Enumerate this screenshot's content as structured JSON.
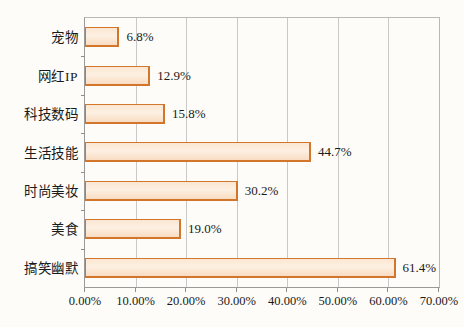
{
  "chart_data": {
    "type": "bar",
    "orientation": "horizontal",
    "title": "",
    "xlabel": "",
    "ylabel": "",
    "categories": [
      "宠物",
      "网红IP",
      "科技数码",
      "生活技能",
      "时尚美妆",
      "美食",
      "搞笑幽默"
    ],
    "values": [
      6.8,
      12.9,
      15.8,
      44.7,
      30.2,
      19.0,
      61.4
    ],
    "value_labels": [
      "6.8%",
      "12.9%",
      "15.8%",
      "44.7%",
      "30.2%",
      "19.0%",
      "61.4%"
    ],
    "xlim": [
      0,
      70
    ],
    "xticks": [
      0,
      10,
      20,
      30,
      40,
      50,
      60,
      70
    ],
    "xtick_labels": [
      "0.00%",
      "10.00%",
      "20.00%",
      "30.00%",
      "40.00%",
      "50.00%",
      "60.00%",
      "70.00%"
    ],
    "grid": "vertical",
    "legend": "none",
    "bar_fill_color": "#fbe6d2",
    "bar_border_color": "#d2762b",
    "gridline_color": "#c9c9c9",
    "axis_color": "#9a9a9a",
    "background_color": "#fdfcf8",
    "text_color": "#1a1a1a"
  }
}
